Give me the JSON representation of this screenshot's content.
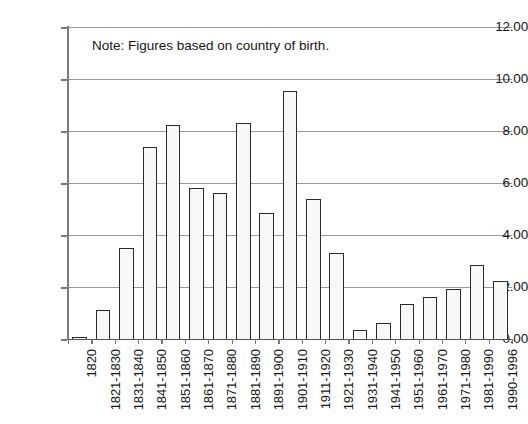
{
  "chart_data": {
    "type": "bar",
    "title": "",
    "subtitle": "",
    "xlabel": "",
    "ylabel": "",
    "ylim": [
      0,
      12
    ],
    "ytick_step": 2,
    "grid": true,
    "legend": "none",
    "annotation": "Note: Figures based on country of birth.",
    "ytick_labels": [
      "0.00",
      "2.00",
      "4.00",
      "6.00",
      "8.00",
      "10.00",
      "12.00"
    ],
    "ytick_values": [
      0,
      2,
      4,
      6,
      8,
      10,
      12
    ],
    "categories": [
      "1820",
      "1821-1830",
      "1831-1840",
      "1841-1850",
      "1851-1860",
      "1861-1870",
      "1871-1880",
      "1881-1890",
      "1891-1900",
      "1901-1910",
      "1911-1920",
      "1921-1930",
      "1931-1940",
      "1941-1950",
      "1951-1960",
      "1961-1970",
      "1971-1980",
      "1981-1990",
      "1990-1996"
    ],
    "values": [
      0.08,
      1.12,
      3.5,
      7.38,
      8.25,
      5.8,
      5.6,
      8.3,
      4.85,
      9.55,
      5.4,
      3.3,
      0.35,
      0.6,
      1.35,
      1.6,
      1.92,
      2.85,
      2.25
    ],
    "bar_fill_color": "#f8f8f8",
    "bar_border_color": "#2a2a2a",
    "grid_color": "#9a9a9a",
    "axis_color": "#777777",
    "text_color": "#161616",
    "background_color": "#ffffff"
  }
}
